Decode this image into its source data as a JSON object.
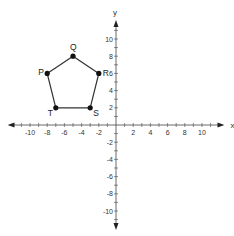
{
  "chart_data": {
    "type": "scatter",
    "title": "",
    "xlabel": "x",
    "ylabel": "y",
    "xlim": [
      -10,
      10
    ],
    "ylim": [
      -10,
      10
    ],
    "grid": false,
    "x_tick_labels": [
      "-10",
      "-8",
      "-6",
      "-4",
      "-2",
      "2",
      "4",
      "6",
      "8",
      "10"
    ],
    "y_tick_labels": [
      "10",
      "8",
      "6",
      "4",
      "2",
      "-2",
      "-4",
      "-6",
      "-8",
      "-10"
    ],
    "polygon": "pentagon PQRST",
    "points": [
      {
        "label": "P",
        "x": -8,
        "y": 6
      },
      {
        "label": "Q",
        "x": -5,
        "y": 8
      },
      {
        "label": "R",
        "x": -2,
        "y": 6
      },
      {
        "label": "S",
        "x": -3,
        "y": 2
      },
      {
        "label": "T",
        "x": -7,
        "y": 2
      }
    ]
  }
}
